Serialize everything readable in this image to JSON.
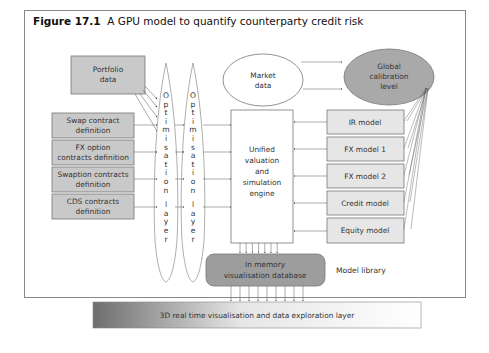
{
  "figure": {
    "number": "Figure 17.1",
    "caption": "A GPU model to quantify counterparty credit risk"
  },
  "inputs": {
    "portfolio": [
      "Portfolio",
      "data"
    ],
    "contracts": [
      [
        "Swap contract",
        "definition"
      ],
      [
        "FX option",
        "contracts definition"
      ],
      [
        "Swaption contracts",
        "definition"
      ],
      [
        "CDS contracts",
        "definition"
      ]
    ]
  },
  "optimisation_layers": [
    {
      "label": "Optimisation layer"
    },
    {
      "label": "Optimisation layer"
    }
  ],
  "market_data": [
    "Market",
    "data"
  ],
  "global_calibration": [
    "Global",
    "calibration",
    "level"
  ],
  "engine": [
    "Unified",
    "valuation",
    "and",
    "simulation",
    "engine"
  ],
  "models": [
    "IR model",
    "FX model 1",
    "FX model 2",
    "Credit model",
    "Equity model"
  ],
  "model_library_label": "Model library",
  "database": [
    "In memory",
    "visualisation database"
  ],
  "exploration_layer": "3D real time visualisation and data exploration layer",
  "colors": {
    "box_fill": "#c9c9c9",
    "model_fill": "#e6e6e6",
    "global_fill": "#a9a9a9",
    "db_fill": "#9d9d9d",
    "border": "#777777"
  }
}
